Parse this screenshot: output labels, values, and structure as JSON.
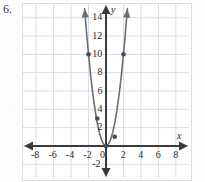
{
  "problem": {
    "number": "6.",
    "margin_mark": "·"
  },
  "axes": {
    "x_axis_name": "x",
    "y_axis_name": "y",
    "x_tick_labels": [
      "-8",
      "-6",
      "-4",
      "-2",
      "0",
      "2",
      "4",
      "6",
      "8"
    ],
    "x_tick_values": [
      -8,
      -6,
      -4,
      -2,
      0,
      2,
      4,
      6,
      8
    ],
    "y_tick_labels": [
      "14",
      "12",
      "10",
      "8",
      "6",
      "4",
      "2",
      "-2"
    ],
    "y_tick_values": [
      14,
      12,
      10,
      8,
      6,
      4,
      2,
      -2
    ],
    "origin_label": "0"
  },
  "colors": {
    "grid": "#d9dde2",
    "axis": "#3a3a3a",
    "curve": "#6e6e7a",
    "point": "#4a4a55",
    "frame": "#dddddd",
    "page": "#fdfdfd"
  },
  "chart_data": {
    "type": "line",
    "title": "",
    "xlabel": "x",
    "ylabel": "y",
    "xlim": [
      -9.5,
      9.5
    ],
    "ylim": [
      -3.5,
      15.5
    ],
    "grid": true,
    "grid_step": 2,
    "legend": "none",
    "series": [
      {
        "name": "parabola",
        "equation": "y = 2.5x^2",
        "x": [
          -2.45,
          -2.2,
          -2,
          -1.75,
          -1.5,
          -1.25,
          -1,
          -0.75,
          -0.5,
          -0.25,
          0,
          0.25,
          0.5,
          0.75,
          1,
          1.25,
          1.5,
          1.75,
          2,
          2.2,
          2.45
        ],
        "y": [
          15,
          12.1,
          10,
          7.66,
          5.63,
          3.91,
          2.5,
          1.41,
          0.63,
          0.16,
          0,
          0.16,
          0.63,
          1.41,
          2.5,
          3.91,
          5.63,
          7.66,
          10,
          12.1,
          15
        ]
      }
    ],
    "points": [
      {
        "x": -2,
        "y": 10
      },
      {
        "x": -1,
        "y": 3
      },
      {
        "x": 0,
        "y": 0
      },
      {
        "x": 1,
        "y": 1
      },
      {
        "x": 2,
        "y": 10
      }
    ],
    "arrows": [
      "curve-left-up",
      "curve-right-up",
      "x-axis-left",
      "x-axis-right",
      "y-axis-up",
      "y-axis-down"
    ]
  }
}
